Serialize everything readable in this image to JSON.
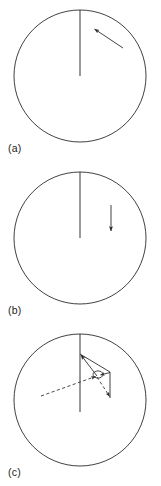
{
  "figure": {
    "background_color": "#ffffff",
    "stroke_color": "#2b2b2b",
    "width": 161,
    "height": 486,
    "panel_count": 3
  },
  "panels": [
    {
      "id": "a",
      "label": "(a)",
      "circle": {
        "cx": 80,
        "cy": 76,
        "r": 66
      },
      "radius_line": {
        "x1": 80,
        "y1": 10,
        "x2": 80,
        "y2": 76,
        "style": "solid"
      },
      "vectors": [
        {
          "name": "velocity-vector",
          "style": "solid",
          "arrowhead": "filled",
          "from_x": 123,
          "from_y": 48,
          "to_x": 93,
          "to_y": 28,
          "direction": "up-left"
        }
      ]
    },
    {
      "id": "b",
      "label": "(b)",
      "circle": {
        "cx": 80,
        "cy": 76,
        "r": 66
      },
      "radius_line": {
        "x1": 80,
        "y1": 10,
        "x2": 80,
        "y2": 76,
        "style": "solid"
      },
      "vectors": [
        {
          "name": "velocity-vector",
          "style": "solid",
          "arrowhead": "filled",
          "from_x": 111,
          "from_y": 43,
          "to_x": 111,
          "to_y": 71,
          "direction": "down"
        }
      ]
    },
    {
      "id": "c",
      "label": "(c)",
      "circle": {
        "cx": 80,
        "cy": 76,
        "r": 66
      },
      "radius_line": {
        "x1": 80,
        "y1": 10,
        "x2": 80,
        "y2": 88,
        "style": "solid"
      },
      "vectors": [
        {
          "name": "resultant-vector-up-left",
          "style": "solid",
          "arrowhead": "filled",
          "from_x": 97,
          "from_y": 52,
          "to_x": 80,
          "to_y": 30,
          "direction": "up-left"
        },
        {
          "name": "component-vector-right",
          "style": "solid",
          "arrowhead": "none",
          "from_x": 80,
          "from_y": 30,
          "to_x": 110,
          "to_y": 48,
          "direction": "down-right"
        },
        {
          "name": "component-vector-down",
          "style": "solid",
          "arrowhead": "none",
          "from_x": 110,
          "from_y": 48,
          "to_x": 110,
          "to_y": 74,
          "direction": "down"
        },
        {
          "name": "component-vector-to-vertex",
          "style": "solid",
          "arrowhead": "filled",
          "from_x": 110,
          "from_y": 48,
          "to_x": 99,
          "to_y": 51,
          "direction": "left"
        },
        {
          "name": "dashed-vector-lower-left",
          "style": "dashed",
          "arrowhead": "filled",
          "from_x": 41,
          "from_y": 72,
          "to_x": 97,
          "to_y": 52,
          "direction": "up-right"
        },
        {
          "name": "dashed-vector-lower-right",
          "style": "dashed",
          "arrowhead": "filled",
          "from_x": 97,
          "from_y": 52,
          "to_x": 110,
          "to_y": 74,
          "direction": "down-right"
        }
      ],
      "marker": {
        "name": "angle-marker",
        "cx": 97,
        "cy": 51,
        "rx": 5,
        "ry": 3.5
      }
    }
  ]
}
